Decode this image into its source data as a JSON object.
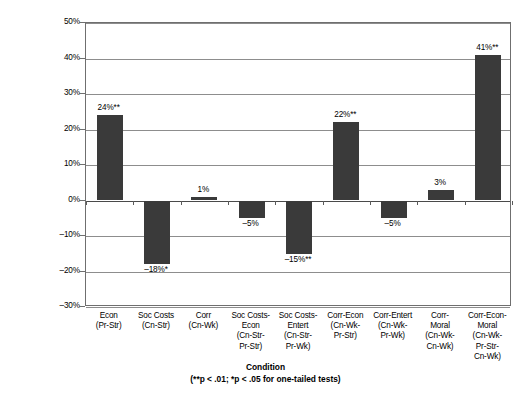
{
  "chart_data": {
    "type": "bar",
    "title": "",
    "xlabel": "Condition",
    "xlabel_note": "(**p < .01; *p < .05 for one-tailed tests)",
    "ylabel": "Relative Impact of Messages\n(compared to control)",
    "ylim": [
      -30,
      50
    ],
    "ytick_labels": [
      "50%",
      "40%",
      "30%",
      "20%",
      "10%",
      "0%",
      "–10%",
      "–20%",
      "–30%"
    ],
    "ytick_values": [
      50,
      40,
      30,
      20,
      10,
      0,
      -10,
      -20,
      -30
    ],
    "grid": true,
    "legend": "none",
    "bar_color": "#3a3a3a",
    "categories": [
      "Econ\n(Pr-Str)",
      "Soc Costs\n(Cn-Str)",
      "Corr\n(Cn-Wk)",
      "Soc Costs-\nEcon\n(Cn-Str-\nPr-Str)",
      "Soc Costs-\nEntert\n(Cn-Str-\nPr-Wk)",
      "Corr-Econ\n(Cn-Wk-\nPr-Str)",
      "Corr-Entert\n(Cn-Wk-\nPr-Wk)",
      "Corr-\nMoral\n(Cn-Wk-\nCn-Wk)",
      "Corr-Econ-\nMoral\n(Cn-Wk-\nPr-Str-\nCn-Wk)"
    ],
    "values": [
      24,
      -18,
      1,
      -5,
      -15,
      22,
      -5,
      3,
      41
    ],
    "data_labels": [
      "24%**",
      "–18%*",
      "1%",
      "–5%",
      "–15%**",
      "22%**",
      "–5%",
      "3%",
      "41%**"
    ]
  }
}
